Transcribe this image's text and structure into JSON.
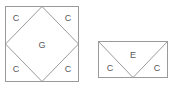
{
  "diagram": {
    "background_color": "#ffffff",
    "stroke_color": "#9a9a9a",
    "label_color": "#58585a",
    "figures": [
      {
        "id": "square-with-inscribed-diamond",
        "shape": "square",
        "outer": {
          "x": 5,
          "y": 6,
          "width": 74,
          "height": 76
        },
        "inner_shape": "diamond",
        "inner_vertices": "midpoints of each square side",
        "regions": [
          {
            "name": "center-diamond",
            "label": "G",
            "label_x": 42,
            "label_y": 46
          },
          {
            "name": "corner-top-left",
            "label": "C",
            "label_x": 16,
            "label_y": 19
          },
          {
            "name": "corner-top-right",
            "label": "C",
            "label_x": 68,
            "label_y": 19
          },
          {
            "name": "corner-bottom-left",
            "label": "C",
            "label_x": 16,
            "label_y": 70
          },
          {
            "name": "corner-bottom-right",
            "label": "C",
            "label_x": 68,
            "label_y": 70
          }
        ]
      },
      {
        "id": "rectangle-with-v-division",
        "shape": "rectangle",
        "outer": {
          "x": 98,
          "y": 41,
          "width": 70,
          "height": 37
        },
        "inner_shape": "v-wedge",
        "inner_vertices": "top-left corner and top-right corner to bottom-edge midpoint",
        "regions": [
          {
            "name": "center-wedge",
            "label": "E",
            "label_x": 133,
            "label_y": 56
          },
          {
            "name": "side-left",
            "label": "C",
            "label_x": 110,
            "label_y": 69
          },
          {
            "name": "side-right",
            "label": "C",
            "label_x": 157,
            "label_y": 69
          }
        ]
      }
    ]
  }
}
